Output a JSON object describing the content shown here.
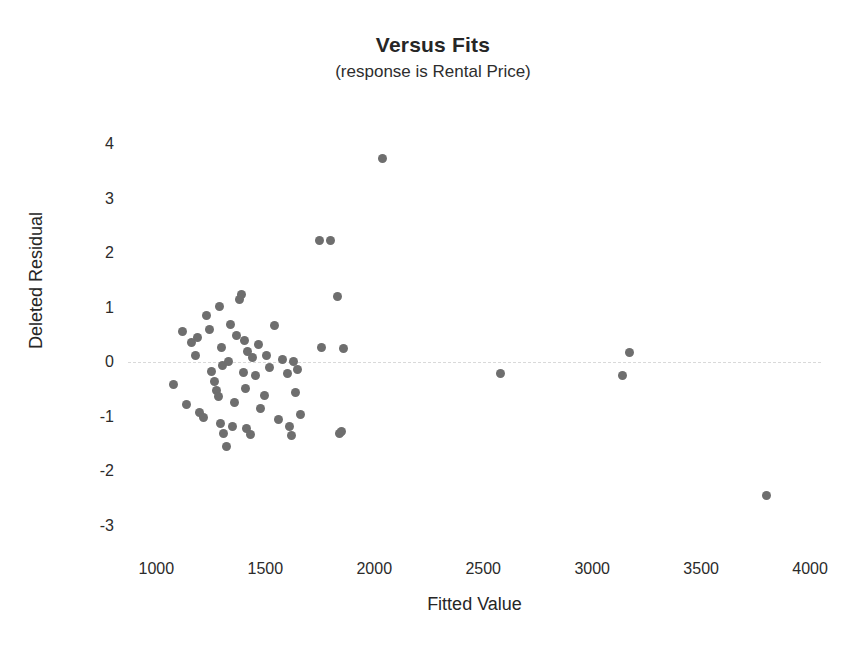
{
  "chart_data": {
    "type": "scatter",
    "title": "Versus Fits",
    "subtitle": "(response is Rental Price)",
    "xlabel": "Fitted Value",
    "ylabel": "Deleted Residual",
    "xlim": [
      870,
      4050
    ],
    "ylim": [
      -3.35,
      4.35
    ],
    "xticks": [
      1000,
      1500,
      2000,
      2500,
      3000,
      3500,
      4000
    ],
    "yticks": [
      4,
      3,
      2,
      1,
      0,
      -1,
      -2,
      -3
    ],
    "grid": false,
    "legend": null,
    "reference_line": {
      "axis": "y",
      "value": 0,
      "style": "dashed",
      "color": "#d9d9d9"
    },
    "marker": {
      "shape": "circle",
      "color": "#6e6e6e",
      "size": 9
    },
    "x": [
      1080,
      1120,
      1140,
      1160,
      1180,
      1190,
      1200,
      1215,
      1230,
      1245,
      1255,
      1265,
      1275,
      1285,
      1290,
      1295,
      1300,
      1305,
      1310,
      1320,
      1330,
      1340,
      1350,
      1360,
      1370,
      1380,
      1390,
      1400,
      1405,
      1410,
      1415,
      1420,
      1430,
      1440,
      1455,
      1470,
      1480,
      1495,
      1505,
      1520,
      1540,
      1560,
      1580,
      1600,
      1610,
      1620,
      1630,
      1640,
      1650,
      1660,
      1750,
      1760,
      1800,
      1830,
      1840,
      1850,
      1860,
      2040,
      2580,
      3140,
      3170,
      3800
    ],
    "y": [
      -0.4,
      0.56,
      -0.78,
      0.37,
      0.13,
      0.45,
      -0.92,
      -1.02,
      0.85,
      0.6,
      -0.16,
      -0.36,
      -0.51,
      -0.62,
      1.02,
      -1.12,
      0.28,
      -0.05,
      -1.3,
      -1.55,
      0.02,
      0.7,
      -1.18,
      -0.74,
      0.5,
      1.15,
      1.25,
      -0.18,
      0.4,
      -0.48,
      -1.22,
      0.2,
      -1.32,
      0.08,
      -0.25,
      0.33,
      -0.85,
      -0.6,
      0.12,
      -0.1,
      0.68,
      -1.05,
      0.05,
      -0.2,
      -1.18,
      -1.35,
      0.02,
      -0.55,
      -0.14,
      -0.95,
      2.23,
      0.27,
      2.23,
      1.2,
      -1.3,
      -1.26,
      0.26,
      3.73,
      -0.21,
      -0.25,
      0.18,
      -2.45
    ]
  }
}
